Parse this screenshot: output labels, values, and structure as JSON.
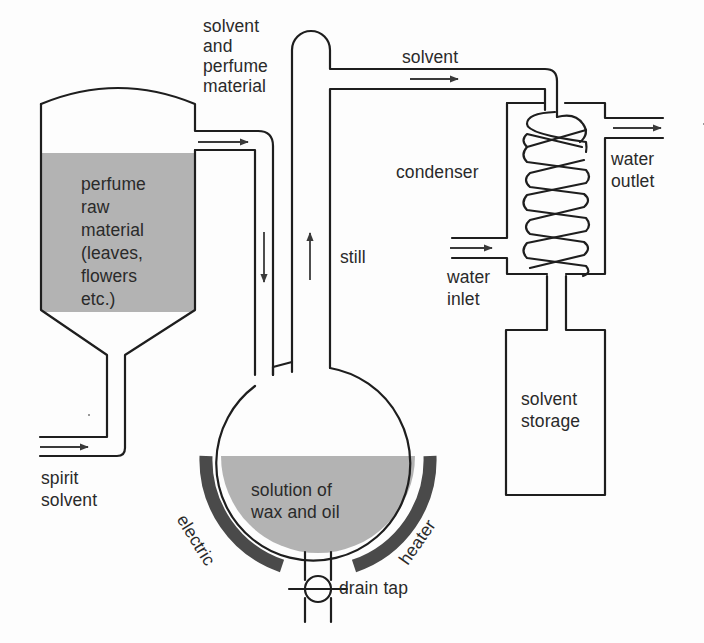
{
  "diagram": {
    "colors": {
      "line": "#1e1e1e",
      "fill_liquid": "#b3b3b3",
      "heater": "#4a4a4a",
      "arrow": "#3a3a3a",
      "background": "#fdfdfd"
    },
    "labels": {
      "solvent_and_perfume": "solvent\nand\nperfume\nmaterial",
      "raw_material": "perfume\nraw\nmaterial\n(leaves,\nflowers\netc.)",
      "spirit_solvent": "spirit\nsolvent",
      "solvent_top": "solvent",
      "condenser": "condenser",
      "water_outlet": "water\noutlet",
      "water_inlet": "water\ninlet",
      "still": "still",
      "solvent_storage": "solvent\nstorage",
      "solution": "solution of\nwax and oil",
      "electric": "electric",
      "heater": "heater",
      "drain_tap": "drain tap"
    },
    "components": [
      {
        "id": "extraction-tank",
        "contents": "perfume raw material (leaves, flowers etc.)"
      },
      {
        "id": "still",
        "contents": "solution of wax and oil"
      },
      {
        "id": "condenser",
        "inputs": [
          "water inlet"
        ],
        "outputs": [
          "water outlet"
        ]
      },
      {
        "id": "solvent-storage"
      },
      {
        "id": "electric-heater"
      },
      {
        "id": "drain-tap"
      }
    ],
    "flows": [
      {
        "from": "spirit solvent inlet",
        "to": "extraction-tank",
        "direction": "right"
      },
      {
        "from": "extraction-tank",
        "to": "still",
        "label": "solvent and perfume material"
      },
      {
        "from": "still",
        "to": "condenser",
        "label": "solvent"
      },
      {
        "from": "condenser",
        "to": "solvent-storage"
      },
      {
        "from": "water inlet",
        "to": "condenser"
      },
      {
        "from": "condenser",
        "to": "water outlet"
      }
    ]
  }
}
